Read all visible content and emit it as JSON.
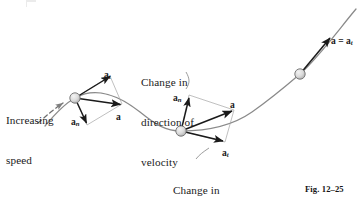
{
  "figure": {
    "caption": "Fig. 12–25",
    "annotations": [
      {
        "id": "increasing-speed",
        "lines": [
          "Increasing",
          "speed"
        ],
        "x": 6,
        "y": 88
      },
      {
        "id": "change-in-direction",
        "lines": [
          "Change in",
          "direction of",
          "velocity"
        ],
        "x": 141,
        "y": 50
      },
      {
        "id": "change-in-magnitude",
        "lines": [
          "Change in",
          "magnitude of",
          "velocity"
        ],
        "x": 173,
        "y": 158
      }
    ],
    "particles": [
      {
        "id": "particle-left",
        "cx": 75,
        "cy": 98,
        "r": 5.2
      },
      {
        "id": "particle-middle",
        "cx": 181,
        "cy": 131,
        "r": 5.2
      },
      {
        "id": "particle-right",
        "cx": 300,
        "cy": 74,
        "r": 5.2
      }
    ],
    "vector_labels": [
      {
        "id": "label-at-left",
        "symbol": "a",
        "sub": "t",
        "x": 104,
        "y": 70
      },
      {
        "id": "label-a-left",
        "symbol": "a",
        "sub": "",
        "x": 116,
        "y": 112
      },
      {
        "id": "label-an-left",
        "symbol": "a",
        "sub": "n",
        "x": 71,
        "y": 117
      },
      {
        "id": "label-an-middle",
        "symbol": "a",
        "sub": "n",
        "x": 173,
        "y": 93
      },
      {
        "id": "label-a-middle",
        "symbol": "a",
        "sub": "",
        "x": 230,
        "y": 100
      },
      {
        "id": "label-at-middle",
        "symbol": "a",
        "sub": "t",
        "x": 222,
        "y": 148
      },
      {
        "id": "label-a-equals-at",
        "symbol": "a = a",
        "sub": "t",
        "x": 331,
        "y": 36
      }
    ],
    "colors": {
      "path": "#8a8a8a",
      "vector": "#1a1a1a",
      "construction": "#9a9a9a",
      "particle_fill": "#d9d9d9",
      "particle_stroke": "#6f6f6f",
      "text": "#1a1a1a",
      "background": "#ffffff"
    }
  }
}
